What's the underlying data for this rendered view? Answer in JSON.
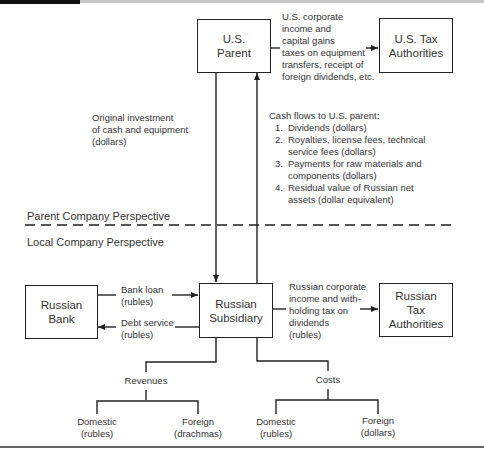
{
  "nodes": {
    "us_parent": "U.S.\nParent",
    "us_tax": "U.S. Tax\nAuthorities",
    "russian_bank": "Russian\nBank",
    "russian_subsidiary": "Russian\nSubsidiary",
    "russian_tax": "Russian\nTax\nAuthorities"
  },
  "labels": {
    "us_tax_flow": [
      "U.S. corporate",
      "income and",
      "capital gains",
      "taxes on equipment",
      "transfers, receipt of",
      "foreign dividends, etc."
    ],
    "original_investment": [
      "Original investment",
      "of cash and equipment",
      "(dollars)"
    ],
    "cash_flows_title": "Cash flows to U.S. parent:",
    "cash_flows": [
      {
        "num": "1.",
        "lines": [
          "Dividends (dollars)"
        ]
      },
      {
        "num": "2.",
        "lines": [
          "Royalties, license fees, technical",
          "service fees (dollars)"
        ]
      },
      {
        "num": "3.",
        "lines": [
          "Payments for raw materials and",
          "components (dollars)"
        ]
      },
      {
        "num": "4.",
        "lines": [
          "Residual value of Russian net",
          "assets (dollar equivalent)"
        ]
      }
    ],
    "parent_perspective": "Parent Company Perspective",
    "local_perspective": "Local Company Perspective",
    "bank_loan": [
      "Bank loan",
      "(rubles)"
    ],
    "debt_service": [
      "Debt service",
      "(rubles)"
    ],
    "russian_tax_flow": [
      "Russian corporate",
      "income and with-",
      "holding tax on",
      "dividends",
      "(rubles)"
    ],
    "revenues": "Revenues",
    "costs": "Costs",
    "rev_domestic": [
      "Domestic",
      "(rubles)"
    ],
    "rev_foreign": [
      "Foreign",
      "(drachmas)"
    ],
    "cost_domestic": [
      "Domestic",
      "(rubles)"
    ],
    "cost_foreign": [
      "Foreign",
      "(dollars)"
    ]
  },
  "colors": {
    "line": "#222222",
    "text": "#333333"
  }
}
